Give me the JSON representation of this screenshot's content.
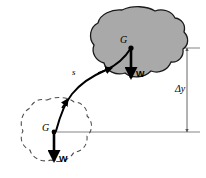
{
  "figure": {
    "background_color": "#ffffff"
  },
  "bodies": {
    "final": {
      "name": "final-position-body",
      "style": "solid-outline-gray-fill",
      "fill_color": "#a9a9a9",
      "stroke_color": "#1a1a1a",
      "center_label": "G",
      "weight_label": "W"
    },
    "initial": {
      "name": "initial-position-body",
      "style": "dashed-outline-no-fill",
      "fill_color": "none",
      "stroke_color": "#4d4d4d",
      "center_label": "G",
      "weight_label": "W"
    }
  },
  "path": {
    "label": "s",
    "stroke_color": "#000000",
    "arrow_count": 2,
    "direction": "from initial G upward to final G"
  },
  "dimension": {
    "label": "Δy",
    "name": "delta-y",
    "stroke_color": "#555555",
    "arrow_style": "double-headed",
    "top_value_y": 48,
    "bottom_value_y": 132
  },
  "reference_lines": {
    "upper": {
      "name": "upper-datum-line",
      "color": "#777777"
    },
    "lower": {
      "name": "lower-datum-line",
      "color": "#777777"
    }
  },
  "labels": {
    "upper_g": "G",
    "upper_w": "W",
    "lower_g": "G",
    "lower_w": "W",
    "path_s": "s",
    "delta_y": "Δy"
  }
}
